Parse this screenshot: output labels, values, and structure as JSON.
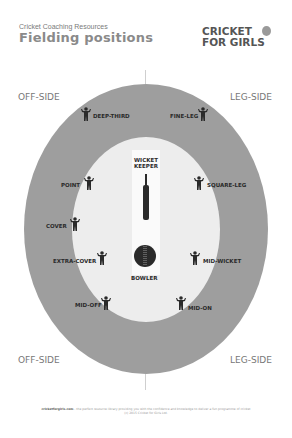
{
  "header": {
    "subtitle": "Cricket Coaching Resources",
    "title": "Fielding positions",
    "logo_line1": "CRICKET",
    "logo_line2": "FOR GIRLS"
  },
  "sides": {
    "top_left": "OFF-SIDE",
    "top_right": "LEG-SIDE",
    "bottom_left": "OFF-SIDE",
    "bottom_right": "LEG-SIDE"
  },
  "positions": {
    "deep_third": "DEEP-THIRD",
    "fine_leg": "FINE-LEG",
    "point": "POINT",
    "square_leg": "SQUARE-LEG",
    "cover": "COVER",
    "extra_cover": "EXTRA-COVER",
    "mid_wicket": "MID-WICKET",
    "mid_off": "MID-OFF",
    "mid_on": "MID-ON",
    "wicket_keeper_1": "WICKET",
    "wicket_keeper_2": "KEEPER",
    "bowler": "BOWLER"
  },
  "colors": {
    "outfield": "#9e9e9e",
    "infield": "#ededed",
    "pitch": "#fafafa",
    "figure": "#2a2a2a"
  },
  "footer": {
    "site": "cricketforgirls.com",
    "text": "- the perfect resource library providing you with the confidence and knowledge to deliver a fun programme of cricket",
    "copyright": "(c) 2015 Cricket for Girls Ltd."
  }
}
